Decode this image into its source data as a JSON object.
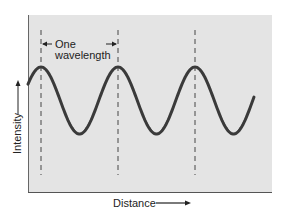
{
  "figure": {
    "type": "diagram",
    "title": "",
    "annotation": {
      "line1": "One",
      "line2": "wavelength"
    },
    "axes": {
      "xlabel": "Distance",
      "ylabel": "Intensity"
    },
    "colors": {
      "plot_background": "#e4e4e4",
      "axis": "#555555",
      "wave": "#3a3a3a",
      "dash": "#333333",
      "text": "#222222"
    }
  },
  "chart_data": {
    "type": "line",
    "title": "",
    "xlabel": "Distance",
    "ylabel": "Intensity",
    "annotations": [
      "One wavelength"
    ],
    "crest_markers": 3,
    "cycles_shown": 3,
    "grid": false,
    "ticks": false
  }
}
